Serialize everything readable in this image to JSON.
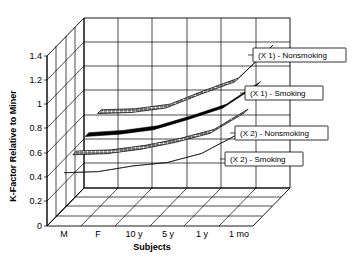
{
  "chart_data": {
    "type": "line",
    "title": "",
    "subtitle": "",
    "xlabel": "Subjects",
    "ylabel": "K-Factor Relative to Miner",
    "zlabel": "",
    "categories": [
      "M",
      "F",
      "10 y",
      "5 y",
      "1 y",
      "1 mo"
    ],
    "ytick_labels": [
      "0",
      "0.2",
      "0.4",
      "0.6",
      "0.8",
      "1",
      "1.2",
      "1.4"
    ],
    "ytick_values": [
      0,
      0.2,
      0.4,
      0.6,
      0.8,
      1,
      1.2,
      1.4
    ],
    "ylim": [
      0,
      1.5
    ],
    "grid": true,
    "legend_position": "inline-right",
    "projection": "3d-ribbon",
    "series": [
      {
        "name": "(X 1) - Nonsmoking",
        "pattern": "crosshatch",
        "depth_index": 3,
        "values": [
          0.69,
          0.7,
          0.74,
          0.86,
          0.97,
          1.26
        ]
      },
      {
        "name": "(X 1) - Smoking",
        "pattern": "solid-black",
        "depth_index": 2,
        "values": [
          0.6,
          0.62,
          0.66,
          0.75,
          0.85,
          1.05
        ]
      },
      {
        "name": "(X 2) - Nonsmoking",
        "pattern": "crosshatch",
        "depth_index": 1,
        "values": [
          0.55,
          0.56,
          0.6,
          0.66,
          0.74,
          0.92
        ]
      },
      {
        "name": "(X 2) - Smoking",
        "pattern": "solid-black",
        "depth_index": 0,
        "values": [
          0.47,
          0.48,
          0.53,
          0.56,
          0.64,
          0.8
        ]
      }
    ]
  },
  "axes": {
    "y_title": "K-Factor Relative to Miner",
    "x_title": "Subjects",
    "y_ticks": [
      "1.4",
      "1.2",
      "1",
      "0.8",
      "0.6",
      "0.4",
      "0.2",
      "0"
    ],
    "x_ticks": [
      "M",
      "F",
      "10 y",
      "5 y",
      "1 y",
      "1 mo"
    ]
  },
  "legend": {
    "items": [
      {
        "label": "(X 1) - Nonsmoking"
      },
      {
        "label": "(X 1) - Smoking"
      },
      {
        "label": "(X 2) - Nonsmoking"
      },
      {
        "label": "(X 2) - Smoking"
      }
    ]
  },
  "colors": {
    "background": "#ffffff",
    "line": "#000000",
    "ribbon_solid": "#000000",
    "ribbon_hatch_fill": "#ffffff",
    "legend_box_fill": "#ffffff"
  }
}
